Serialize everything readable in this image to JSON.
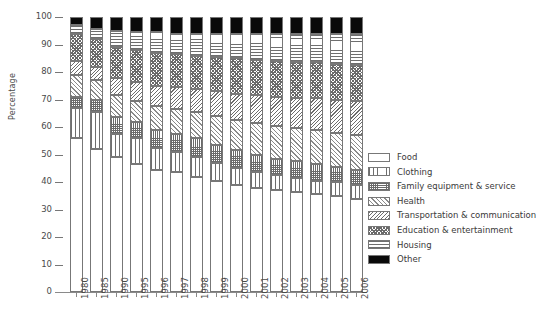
{
  "chart_data": {
    "type": "bar",
    "subtype": "stacked-100-percent",
    "title": "",
    "xlabel": "",
    "ylabel": "Percentage",
    "ylim": [
      0,
      100
    ],
    "yticks": [
      0,
      10,
      20,
      30,
      40,
      50,
      60,
      70,
      80,
      90,
      100
    ],
    "grid": false,
    "legend_position": "right",
    "categories": [
      "1980",
      "1985",
      "1990",
      "1995",
      "1996",
      "1997",
      "1998",
      "1999",
      "2000",
      "2001",
      "2002",
      "2003",
      "2004",
      "2005",
      "2006"
    ],
    "series": [
      {
        "name": "Food",
        "pattern": "blank",
        "values": [
          56.0,
          52.0,
          49.0,
          46.5,
          44.5,
          43.5,
          42.0,
          40.5,
          39.0,
          38.0,
          37.0,
          36.5,
          35.5,
          35.0,
          34.0
        ]
      },
      {
        "name": "Clothing",
        "pattern": "vertical-lines",
        "values": [
          11.0,
          13.5,
          8.5,
          9.5,
          8.0,
          7.5,
          7.0,
          6.5,
          6.0,
          5.5,
          5.5,
          5.0,
          5.0,
          5.0,
          5.0
        ]
      },
      {
        "name": "Family equipment & service",
        "pattern": "grid-crosshatch",
        "values": [
          4.0,
          4.5,
          6.0,
          6.0,
          6.5,
          6.5,
          7.0,
          6.5,
          6.5,
          6.5,
          6.0,
          6.0,
          6.0,
          5.5,
          5.5
        ]
      },
      {
        "name": "Health",
        "pattern": "diagonal-forward",
        "values": [
          8.0,
          7.0,
          8.0,
          7.5,
          8.5,
          9.0,
          9.5,
          10.5,
          11.0,
          11.5,
          12.0,
          12.0,
          12.5,
          12.5,
          12.5
        ]
      },
      {
        "name": "Transportation & communication",
        "pattern": "diagonal-back",
        "values": [
          5.0,
          5.0,
          6.5,
          7.0,
          7.5,
          8.0,
          8.5,
          9.0,
          9.5,
          10.0,
          10.5,
          11.0,
          11.5,
          12.0,
          12.5
        ]
      },
      {
        "name": "Education & entertainment",
        "pattern": "dots-crosshatch",
        "values": [
          10.0,
          10.0,
          11.0,
          11.5,
          12.0,
          12.0,
          12.0,
          12.5,
          13.0,
          13.0,
          13.0,
          13.0,
          13.0,
          13.0,
          13.0
        ]
      },
      {
        "name": "Housing",
        "pattern": "horizontal-lines",
        "values": [
          3.0,
          3.5,
          6.0,
          6.5,
          7.5,
          7.5,
          8.0,
          8.5,
          9.0,
          9.5,
          10.0,
          10.5,
          10.5,
          11.0,
          11.5
        ]
      },
      {
        "name": "Other",
        "pattern": "solid-black",
        "values": [
          3.0,
          4.5,
          5.0,
          5.5,
          5.5,
          6.0,
          6.0,
          6.0,
          6.0,
          6.0,
          6.0,
          6.0,
          6.0,
          6.0,
          6.0
        ]
      }
    ]
  },
  "axis": {
    "ylabel": "Percentage",
    "ytick_labels": [
      "100",
      "90",
      "80",
      "70",
      "60",
      "50",
      "40",
      "30",
      "20",
      "10",
      "0"
    ]
  },
  "legend": {
    "items": [
      {
        "label": "Food",
        "pattern": "p-food"
      },
      {
        "label": "Clothing",
        "pattern": "p-clothing"
      },
      {
        "label": "Family equipment & service",
        "pattern": "p-family"
      },
      {
        "label": "Health",
        "pattern": "p-health"
      },
      {
        "label": "Transportation & communication",
        "pattern": "p-transport"
      },
      {
        "label": "Education & entertainment",
        "pattern": "p-education"
      },
      {
        "label": "Housing",
        "pattern": "p-housing"
      },
      {
        "label": "Other",
        "pattern": "p-other"
      }
    ]
  }
}
